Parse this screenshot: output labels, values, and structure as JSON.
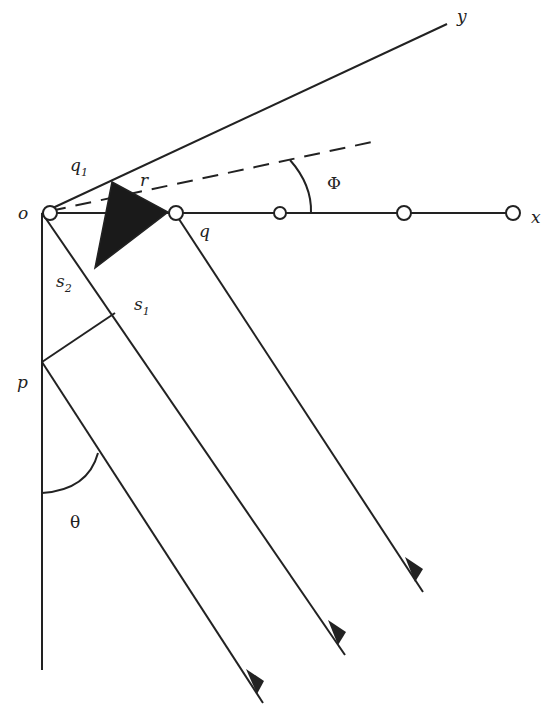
{
  "diagram": {
    "type": "array geometry / plane wave incidence",
    "labels": {
      "origin": "o",
      "x_axis": "x",
      "y_axis": "y",
      "q1": "q",
      "q1_sub": "1",
      "r": "r",
      "q": "q",
      "s1": "s",
      "s1_sub": "1",
      "s2": "s",
      "s2_sub": "2",
      "p": "p",
      "phi": "Φ",
      "theta": "θ"
    },
    "elements": {
      "sensors_on_x_axis": 5,
      "incident_rays": 3,
      "shaded_triangle": "filled source wedge between o-y line and x axis"
    },
    "colors": {
      "stroke": "#222222",
      "fill_triangle": "#1a1a1a",
      "background": "#ffffff"
    }
  }
}
